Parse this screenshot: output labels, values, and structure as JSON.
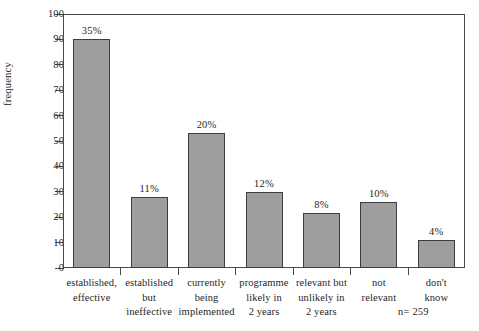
{
  "chart_data": {
    "type": "bar",
    "title": "",
    "xlabel": "",
    "ylabel": "frequency",
    "ylim": [
      0,
      100
    ],
    "ytick_step": 10,
    "grid": false,
    "legend": "none",
    "bar_color": "#9e9e9e",
    "bar_border_color": "#3d3d3d",
    "axis_color": "#4a4a4a",
    "categories": [
      "established, effective",
      "established but ineffective",
      "currently being implemented",
      "programme likely in 2 years",
      "relevant but unlikely in 2 years",
      "not relevant",
      "don't know"
    ],
    "category_lines": [
      [
        "established,",
        "effective"
      ],
      [
        "established",
        "but",
        "ineffective"
      ],
      [
        "currently",
        "being",
        "implemented"
      ],
      [
        "programme",
        "likely in",
        "2 years"
      ],
      [
        "relevant but",
        "unlikely in",
        "2 years"
      ],
      [
        "not",
        "relevant"
      ],
      [
        "don't",
        "know"
      ]
    ],
    "values": [
      90,
      28,
      53,
      30,
      21.5,
      26,
      11
    ],
    "data_labels": [
      "35%",
      "11%",
      "20%",
      "12%",
      "8%",
      "10%",
      "4%"
    ],
    "yticks": [
      0,
      10,
      20,
      30,
      40,
      50,
      60,
      70,
      80,
      90,
      100
    ],
    "ytick_labels": [
      "0",
      "10",
      "20",
      "30",
      "40",
      "50",
      "60",
      "70",
      "80",
      "90",
      "100"
    ],
    "annotations": [
      "n= 259"
    ]
  },
  "footnote": {
    "sample_size": "n= 259"
  }
}
